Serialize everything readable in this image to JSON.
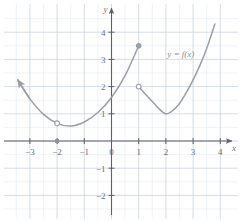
{
  "figure": {
    "title": "",
    "curve_label": "y = f(x)",
    "x_axis_name": "x",
    "y_axis_name": "y"
  },
  "colors": {
    "grid_minor": "#e8ecf2",
    "grid_major": "#ccd3de",
    "axis": "#5d6066",
    "curve": "#9a9ea7",
    "label_text": "#6d6f74",
    "background": "#ffffff"
  },
  "chart_data": {
    "type": "line",
    "title": "",
    "xlabel": "x",
    "ylabel": "y",
    "xlim": [
      -3.6,
      4.3
    ],
    "ylim": [
      -2.6,
      4.5
    ],
    "xticks": [
      -3,
      -2,
      -1,
      0,
      1,
      2,
      3,
      4
    ],
    "xtick_labels": [
      "-3",
      "-2",
      "-1",
      "0",
      "1",
      "2",
      "3",
      "4"
    ],
    "yticks": [
      -2,
      -1,
      1,
      2,
      3,
      4
    ],
    "ytick_labels": [
      "-2",
      "-1",
      "1",
      "2",
      "3",
      "4"
    ],
    "grid": true,
    "grid_major_step": 1,
    "grid_minor_step": 0.5,
    "legend": "none",
    "annotations": [
      {
        "text": "y = f(x)",
        "x": 2.05,
        "y": 3.1
      }
    ],
    "series": [
      {
        "name": "left-branch",
        "type": "parabola",
        "style": "solid",
        "start_marker": "arrow",
        "end_marker": "closed-circle",
        "points": [
          {
            "x": -3.45,
            "y": 2.25
          },
          {
            "x": -3.0,
            "y": 1.55
          },
          {
            "x": -2.5,
            "y": 0.98
          },
          {
            "x": -2.0,
            "y": 0.65
          },
          {
            "x": -1.5,
            "y": 0.55
          },
          {
            "x": -1.0,
            "y": 0.7
          },
          {
            "x": -0.5,
            "y": 1.05
          },
          {
            "x": 0.0,
            "y": 1.6
          },
          {
            "x": 0.5,
            "y": 2.4
          },
          {
            "x": 1.0,
            "y": 3.5
          }
        ]
      },
      {
        "name": "right-branch",
        "type": "parabola",
        "style": "solid",
        "start_marker": "open-circle",
        "end_marker": "none",
        "points": [
          {
            "x": 1.0,
            "y": 2.0
          },
          {
            "x": 1.25,
            "y": 1.72
          },
          {
            "x": 1.5,
            "y": 1.45
          },
          {
            "x": 1.75,
            "y": 1.18
          },
          {
            "x": 2.0,
            "y": 1.0
          },
          {
            "x": 2.25,
            "y": 1.12
          },
          {
            "x": 2.5,
            "y": 1.38
          },
          {
            "x": 2.75,
            "y": 1.78
          },
          {
            "x": 3.0,
            "y": 2.25
          },
          {
            "x": 3.25,
            "y": 2.78
          },
          {
            "x": 3.5,
            "y": 3.4
          },
          {
            "x": 3.8,
            "y": 4.3
          }
        ]
      }
    ],
    "markers": [
      {
        "name": "hole-left-branch",
        "kind": "open-circle",
        "x": -2,
        "y": 0.65
      },
      {
        "name": "endpoint-left-branch",
        "kind": "closed-circle",
        "x": 1,
        "y": 3.5
      },
      {
        "name": "hole-right-branch",
        "kind": "open-circle",
        "x": 1,
        "y": 2.0
      },
      {
        "name": "tick-dot-x-minus-2",
        "kind": "closed-square",
        "x": -2,
        "y": 0
      }
    ]
  }
}
